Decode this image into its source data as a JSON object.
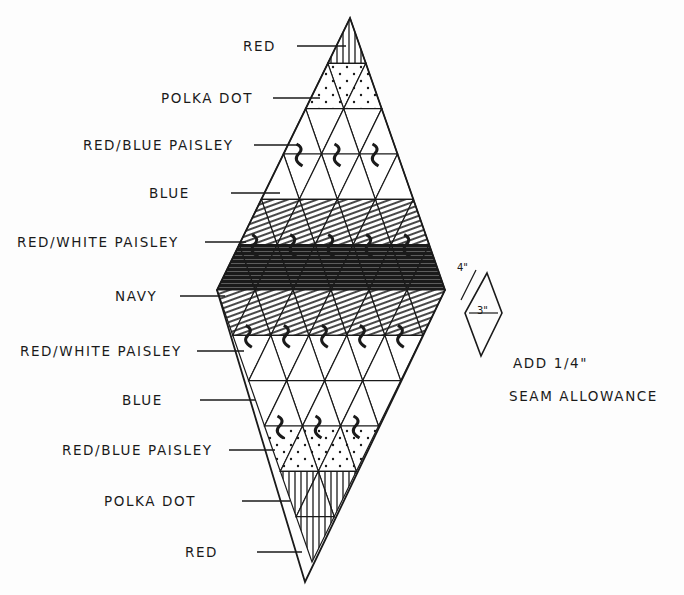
{
  "diagram": {
    "type": "quilt-block-layout",
    "shape": "large diamond made of 6x6 small diamond patches",
    "rows_top_to_bottom": [
      {
        "label": "RED"
      },
      {
        "label": "POLKA DOT"
      },
      {
        "label": "RED/BLUE PAISLEY"
      },
      {
        "label": "BLUE"
      },
      {
        "label": "RED/WHITE PAISLEY"
      },
      {
        "label": "NAVY"
      },
      {
        "label": "RED/WHITE PAISLEY"
      },
      {
        "label": "BLUE"
      },
      {
        "label": "RED/BLUE PAISLEY"
      },
      {
        "label": "POLKA DOT"
      },
      {
        "label": "RED"
      }
    ],
    "template": {
      "side_dimension": "4\"",
      "width_dimension": "3\""
    },
    "note": {
      "line1": "ADD 1/4\"",
      "line2": "SEAM ALLOWANCE"
    },
    "colors": {
      "ink": "#1a1a1a",
      "paper": "#fdfdfd"
    }
  }
}
